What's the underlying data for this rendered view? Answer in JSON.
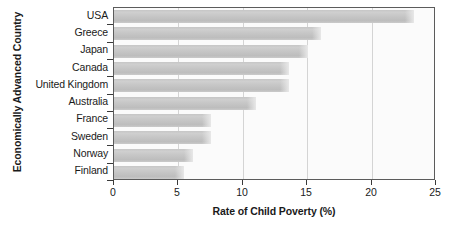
{
  "chart_data": {
    "type": "bar",
    "orientation": "horizontal",
    "title": "",
    "xlabel": "Rate of Child Poverty (%)",
    "ylabel": "Economically Advanced Country",
    "categories": [
      "USA",
      "Greece",
      "Japan",
      "Canada",
      "United Kingdom",
      "Australia",
      "France",
      "Sweden",
      "Norway",
      "Finland"
    ],
    "values": [
      23.3,
      16.1,
      15.1,
      13.6,
      13.6,
      11.0,
      7.5,
      7.5,
      6.1,
      5.4
    ],
    "xlim": [
      0,
      25
    ],
    "xticks": [
      0,
      5,
      10,
      15,
      20,
      25
    ],
    "xtick_labels": [
      "0",
      "5",
      "10",
      "15",
      "20",
      "25"
    ],
    "grid": true,
    "grid_axis": "x",
    "legend": false,
    "bar_color": "#c6c6c6",
    "plot_background": "#fbfbfb",
    "frame_color": "#5b5b5b",
    "gridline_color": "#d4d4d4",
    "text_color": "#1a1a1a"
  }
}
